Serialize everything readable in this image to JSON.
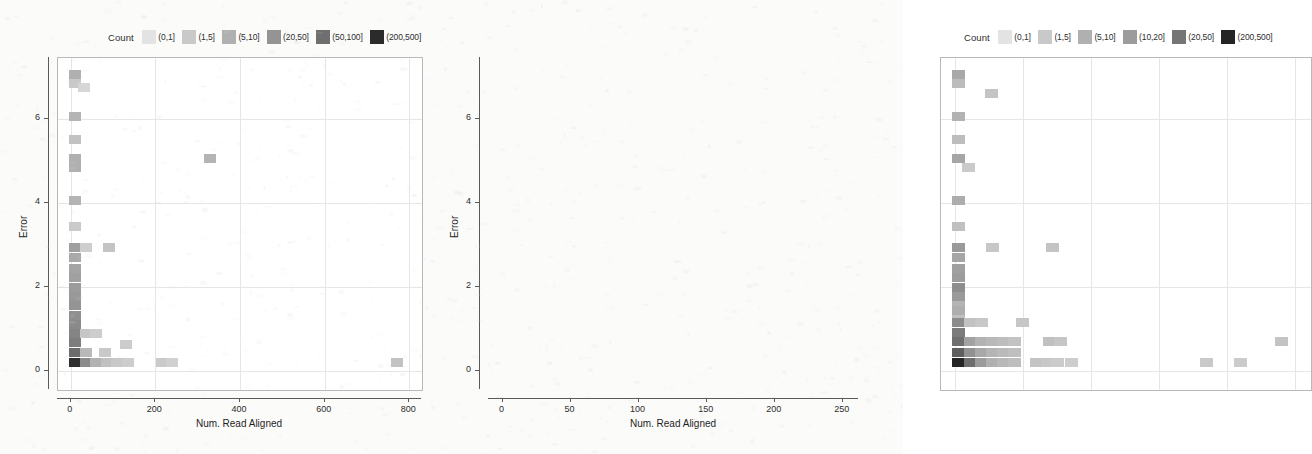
{
  "figure": {
    "background_color": "#fbfbfa",
    "panel_background": "#ffffff",
    "frame_color": "#b9b9b9",
    "grid_color": "#e6e6e6"
  },
  "chart_data": [
    {
      "id": "left",
      "type": "heatmap",
      "title": "",
      "xlabel": "Num. Read Aligned",
      "ylabel": "Error",
      "xlim": [
        -30,
        830
      ],
      "ylim": [
        -0.45,
        7.45
      ],
      "xticks": [
        0,
        200,
        400,
        600,
        800
      ],
      "yticks": [
        0,
        2,
        4,
        6
      ],
      "grid": true,
      "legend": {
        "title": "Count",
        "position": "top",
        "entries": [
          {
            "label": "(0,1]",
            "color": "#e3e3e3"
          },
          {
            "label": "(1,5]",
            "color": "#c9c9c9"
          },
          {
            "label": "(5,10]",
            "color": "#b0b0b0"
          },
          {
            "label": "(20,50]",
            "color": "#949494"
          },
          {
            "label": "(50,100]",
            "color": "#6f6f6f"
          },
          {
            "label": "(200,500]",
            "color": "#2b2b2b"
          }
        ]
      },
      "bin_width_x": 25,
      "bin_width_y": 0.22,
      "cells": [
        {
          "x": 10,
          "y": 7.05,
          "color": "#b0b0b0"
        },
        {
          "x": 10,
          "y": 6.85,
          "color": "#c9c9c9"
        },
        {
          "x": 32,
          "y": 6.75,
          "color": "#d6d6d6"
        },
        {
          "x": 10,
          "y": 6.05,
          "color": "#b4b4b4"
        },
        {
          "x": 10,
          "y": 5.5,
          "color": "#c2c2c2"
        },
        {
          "x": 10,
          "y": 5.05,
          "color": "#b0b0b0"
        },
        {
          "x": 10,
          "y": 4.85,
          "color": "#b0b0b0"
        },
        {
          "x": 330,
          "y": 5.05,
          "color": "#b4b4b4"
        },
        {
          "x": 10,
          "y": 4.05,
          "color": "#b4b4b4"
        },
        {
          "x": 10,
          "y": 3.45,
          "color": "#cacaca"
        },
        {
          "x": 10,
          "y": 2.95,
          "color": "#9f9f9f"
        },
        {
          "x": 35,
          "y": 2.95,
          "color": "#cecece"
        },
        {
          "x": 90,
          "y": 2.95,
          "color": "#c4c4c4"
        },
        {
          "x": 10,
          "y": 2.7,
          "color": "#a9a9a9"
        },
        {
          "x": 10,
          "y": 2.45,
          "color": "#a4a4a4"
        },
        {
          "x": 10,
          "y": 2.22,
          "color": "#a0a0a0"
        },
        {
          "x": 10,
          "y": 2.0,
          "color": "#9b9b9b"
        },
        {
          "x": 10,
          "y": 1.78,
          "color": "#989898"
        },
        {
          "x": 10,
          "y": 1.55,
          "color": "#949494"
        },
        {
          "x": 10,
          "y": 1.33,
          "color": "#8f8f8f"
        },
        {
          "x": 10,
          "y": 1.1,
          "color": "#8a8a8a"
        },
        {
          "x": 10,
          "y": 0.9,
          "color": "#848484"
        },
        {
          "x": 35,
          "y": 0.9,
          "color": "#c6c6c6"
        },
        {
          "x": 60,
          "y": 0.9,
          "color": "#cdcdcd"
        },
        {
          "x": 10,
          "y": 0.67,
          "color": "#7d7d7d"
        },
        {
          "x": 10,
          "y": 0.45,
          "color": "#6c6c6c"
        },
        {
          "x": 35,
          "y": 0.45,
          "color": "#b9b9b9"
        },
        {
          "x": 80,
          "y": 0.45,
          "color": "#c9c9c9"
        },
        {
          "x": 130,
          "y": 0.63,
          "color": "#cccccc"
        },
        {
          "x": 10,
          "y": 0.2,
          "color": "#2e2e2e"
        },
        {
          "x": 35,
          "y": 0.2,
          "color": "#8b8b8b"
        },
        {
          "x": 60,
          "y": 0.2,
          "color": "#b2b2b2"
        },
        {
          "x": 85,
          "y": 0.2,
          "color": "#c0c0c0"
        },
        {
          "x": 110,
          "y": 0.2,
          "color": "#c8c8c8"
        },
        {
          "x": 135,
          "y": 0.2,
          "color": "#cdcdcd"
        },
        {
          "x": 215,
          "y": 0.2,
          "color": "#cacaca"
        },
        {
          "x": 240,
          "y": 0.2,
          "color": "#d0d0d0"
        },
        {
          "x": 770,
          "y": 0.2,
          "color": "#c2c2c2"
        }
      ]
    },
    {
      "id": "right",
      "type": "heatmap",
      "title": "",
      "xlabel": "Num. Read Aligned",
      "ylabel": "Error",
      "xlim": [
        -10,
        262
      ],
      "ylim": [
        -0.45,
        7.45
      ],
      "xticks": [
        0,
        50,
        100,
        150,
        200,
        250
      ],
      "yticks": [
        0,
        2,
        4,
        6
      ],
      "grid": true,
      "legend": {
        "title": "Count",
        "position": "top",
        "entries": [
          {
            "label": "(0,1]",
            "color": "#e3e3e3"
          },
          {
            "label": "(1,5]",
            "color": "#c9c9c9"
          },
          {
            "label": "(5,10]",
            "color": "#b0b0b0"
          },
          {
            "label": "(10,20]",
            "color": "#9c9c9c"
          },
          {
            "label": "(20,50]",
            "color": "#757575"
          },
          {
            "label": "(200,500]",
            "color": "#242424"
          }
        ]
      },
      "bin_width_x": 8,
      "bin_width_y": 0.22,
      "cells": [
        {
          "x": 3,
          "y": 7.05,
          "color": "#a8a8a8"
        },
        {
          "x": 3,
          "y": 6.85,
          "color": "#bcbcbc"
        },
        {
          "x": 27,
          "y": 6.6,
          "color": "#c4c4c4"
        },
        {
          "x": 3,
          "y": 6.05,
          "color": "#b2b2b2"
        },
        {
          "x": 3,
          "y": 5.5,
          "color": "#bdbdbd"
        },
        {
          "x": 3,
          "y": 5.05,
          "color": "#a6a6a6"
        },
        {
          "x": 10,
          "y": 4.85,
          "color": "#cacaca"
        },
        {
          "x": 3,
          "y": 4.05,
          "color": "#adadad"
        },
        {
          "x": 3,
          "y": 3.45,
          "color": "#c0c0c0"
        },
        {
          "x": 3,
          "y": 2.95,
          "color": "#9a9a9a"
        },
        {
          "x": 28,
          "y": 2.95,
          "color": "#c7c7c7"
        },
        {
          "x": 72,
          "y": 2.95,
          "color": "#c4c4c4"
        },
        {
          "x": 3,
          "y": 2.7,
          "color": "#a5a5a5"
        },
        {
          "x": 3,
          "y": 2.45,
          "color": "#a0a0a0"
        },
        {
          "x": 3,
          "y": 2.22,
          "color": "#9c9c9c"
        },
        {
          "x": 3,
          "y": 2.0,
          "color": "#8d8d8d"
        },
        {
          "x": 3,
          "y": 1.78,
          "color": "#9a9a9a"
        },
        {
          "x": 3,
          "y": 1.55,
          "color": "#b4b4b4"
        },
        {
          "x": 3,
          "y": 1.33,
          "color": "#c0c0c0"
        },
        {
          "x": 3,
          "y": 1.45,
          "color": "#aeaeae"
        },
        {
          "x": 3,
          "y": 1.15,
          "color": "#8c8c8c"
        },
        {
          "x": 12,
          "y": 1.15,
          "color": "#c2c2c2"
        },
        {
          "x": 20,
          "y": 1.15,
          "color": "#c8c8c8"
        },
        {
          "x": 50,
          "y": 1.15,
          "color": "#c6c6c6"
        },
        {
          "x": 3,
          "y": 0.92,
          "color": "#7b7b7b"
        },
        {
          "x": 3,
          "y": 0.7,
          "color": "#6f6f6f"
        },
        {
          "x": 12,
          "y": 0.7,
          "color": "#a2a2a2"
        },
        {
          "x": 20,
          "y": 0.7,
          "color": "#b2b2b2"
        },
        {
          "x": 28,
          "y": 0.7,
          "color": "#b8b8b8"
        },
        {
          "x": 36,
          "y": 0.7,
          "color": "#bdbdbd"
        },
        {
          "x": 44,
          "y": 0.7,
          "color": "#c2c2c2"
        },
        {
          "x": 70,
          "y": 0.7,
          "color": "#c0c0c0"
        },
        {
          "x": 78,
          "y": 0.7,
          "color": "#c6c6c6"
        },
        {
          "x": 240,
          "y": 0.7,
          "color": "#c4c4c4"
        },
        {
          "x": 3,
          "y": 0.45,
          "color": "#5e5e5e"
        },
        {
          "x": 12,
          "y": 0.45,
          "color": "#919191"
        },
        {
          "x": 20,
          "y": 0.45,
          "color": "#a8a8a8"
        },
        {
          "x": 28,
          "y": 0.45,
          "color": "#b4b4b4"
        },
        {
          "x": 36,
          "y": 0.45,
          "color": "#bababa"
        },
        {
          "x": 44,
          "y": 0.45,
          "color": "#bfbfbf"
        },
        {
          "x": 3,
          "y": 0.2,
          "color": "#242424"
        },
        {
          "x": 12,
          "y": 0.2,
          "color": "#6e6e6e"
        },
        {
          "x": 20,
          "y": 0.2,
          "color": "#9b9b9b"
        },
        {
          "x": 28,
          "y": 0.2,
          "color": "#b0b0b0"
        },
        {
          "x": 36,
          "y": 0.2,
          "color": "#b8b8b8"
        },
        {
          "x": 44,
          "y": 0.2,
          "color": "#bebebe"
        },
        {
          "x": 60,
          "y": 0.2,
          "color": "#c4c4c4"
        },
        {
          "x": 68,
          "y": 0.2,
          "color": "#c8c8c8"
        },
        {
          "x": 76,
          "y": 0.2,
          "color": "#cbcbcb"
        },
        {
          "x": 86,
          "y": 0.2,
          "color": "#cdcdcd"
        },
        {
          "x": 185,
          "y": 0.2,
          "color": "#c9c9c9"
        },
        {
          "x": 210,
          "y": 0.2,
          "color": "#cbcbcb"
        }
      ]
    }
  ]
}
